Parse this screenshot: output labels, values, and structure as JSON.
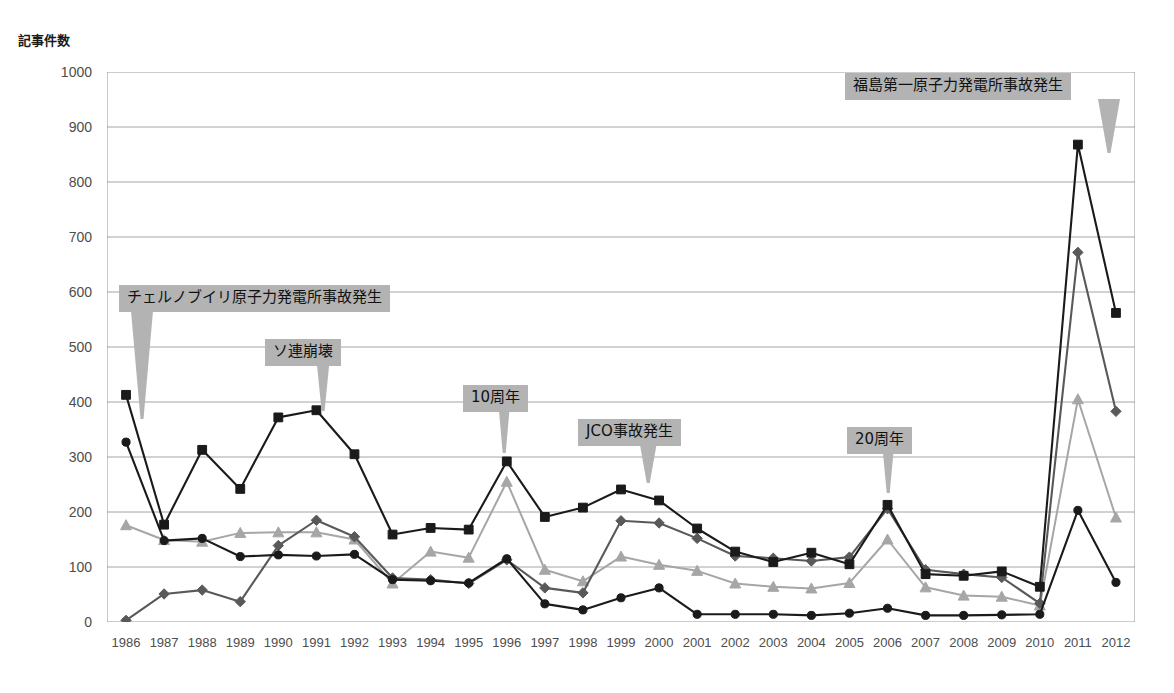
{
  "chart_data": {
    "type": "line",
    "title": "",
    "xlabel": "",
    "ylabel": "記事件数",
    "ylim": [
      0,
      1000
    ],
    "ytick_step": 100,
    "yticks": [
      0,
      100,
      200,
      300,
      400,
      500,
      600,
      700,
      800,
      900,
      1000
    ],
    "grid": true,
    "legend_position": "none",
    "categories": [
      "1986",
      "1987",
      "1988",
      "1989",
      "1990",
      "1991",
      "1992",
      "1993",
      "1994",
      "1995",
      "1996",
      "1997",
      "1998",
      "1999",
      "2000",
      "2001",
      "2002",
      "2003",
      "2004",
      "2005",
      "2006",
      "2007",
      "2008",
      "2009",
      "2010",
      "2011",
      "2012"
    ],
    "series": [
      {
        "name": "series-square",
        "marker": "square",
        "color": "#1a1a1a",
        "values": [
          413,
          177,
          313,
          242,
          372,
          385,
          305,
          159,
          171,
          168,
          292,
          191,
          208,
          241,
          221,
          170,
          128,
          109,
          126,
          105,
          213,
          87,
          84,
          92,
          64,
          868,
          562
        ]
      },
      {
        "name": "series-circle",
        "marker": "circle",
        "color": "#1a1a1a",
        "values": [
          327,
          148,
          152,
          119,
          122,
          120,
          123,
          77,
          75,
          71,
          115,
          33,
          22,
          44,
          62,
          14,
          14,
          14,
          12,
          16,
          25,
          12,
          12,
          13,
          14,
          203,
          72
        ]
      },
      {
        "name": "series-diamond",
        "marker": "diamond",
        "color": "#595959",
        "values": [
          3,
          51,
          58,
          37,
          139,
          185,
          155,
          80,
          77,
          70,
          113,
          62,
          53,
          184,
          180,
          152,
          120,
          116,
          111,
          118,
          206,
          95,
          87,
          81,
          34,
          672,
          383
        ]
      },
      {
        "name": "series-triangle",
        "marker": "triangle",
        "color": "#a6a6a6",
        "values": [
          176,
          149,
          146,
          162,
          163,
          163,
          150,
          70,
          128,
          117,
          255,
          95,
          74,
          119,
          104,
          93,
          70,
          64,
          61,
          71,
          150,
          63,
          48,
          46,
          30,
          405,
          190
        ]
      }
    ],
    "annotations": [
      {
        "id": "chernobyl",
        "label": "チェルノブイリ原子力発電所事故発生",
        "target_category": "1986",
        "target_value": 440
      },
      {
        "id": "soviet-collapse",
        "label": "ソ連崩壊",
        "target_category": "1991",
        "target_value": 385
      },
      {
        "id": "tenth-anniversary",
        "label": "10周年",
        "target_category": "1996",
        "target_value": 300
      },
      {
        "id": "jco-accident",
        "label": "JCO事故発生",
        "target_category": "1999",
        "target_value": 260
      },
      {
        "id": "twentieth-anniversary",
        "label": "20周年",
        "target_category": "2006",
        "target_value": 225
      },
      {
        "id": "fukushima-daiichi",
        "label": "福島第一原子力発電所事故発生",
        "target_category": "2011",
        "target_value": 880
      }
    ]
  }
}
